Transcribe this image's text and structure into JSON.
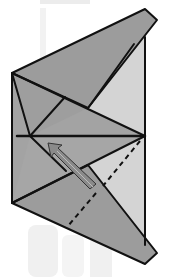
{
  "diagram": {
    "type": "origami-fold-step",
    "colors": {
      "background": "#ffffff",
      "watermark": "#ececec",
      "paper_dark": "#9a9a9a",
      "paper_mid": "#a8a8a8",
      "paper_light": "#d6d6d6",
      "line": "#111111",
      "arrow_fill": "#8a8a8a"
    },
    "elements": [
      {
        "name": "top-flap",
        "shape": "polygon"
      },
      {
        "name": "bottom-flap",
        "shape": "polygon"
      },
      {
        "name": "horizontal-crease",
        "shape": "line"
      },
      {
        "name": "valley-fold-line-upper",
        "shape": "dashed-line"
      },
      {
        "name": "valley-fold-line-lower",
        "shape": "dashed-line"
      },
      {
        "name": "fold-direction-arrow",
        "shape": "arrow"
      }
    ]
  }
}
